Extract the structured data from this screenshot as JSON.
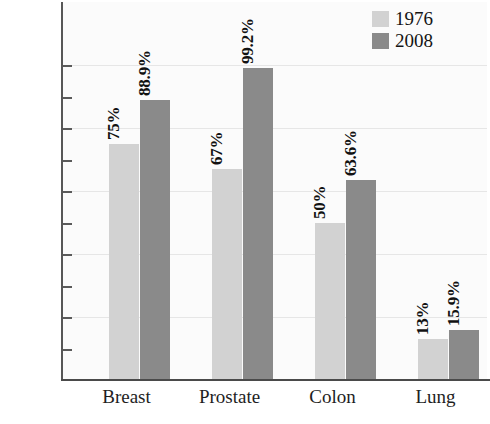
{
  "chart_data": {
    "type": "bar",
    "title": "",
    "subtitle": "",
    "xlabel": "",
    "ylabel": "",
    "categories": [
      "Breast",
      "Prostate",
      "Colon",
      "Lung"
    ],
    "series": [
      {
        "name": "1976",
        "color": "#d2d2d2",
        "values": [
          75,
          67,
          50,
          13
        ],
        "labels": [
          "75%",
          "67%",
          "50%",
          "13%"
        ]
      },
      {
        "name": "2008",
        "color": "#8a8a8a",
        "values": [
          88.9,
          99.2,
          63.6,
          15.9
        ],
        "labels": [
          "88.9%",
          "99.2%",
          "63.6%",
          "15.9%"
        ]
      }
    ],
    "ylim": [
      0,
      110
    ],
    "ytick_values": [
      10,
      20,
      30,
      40,
      50,
      60,
      70,
      80,
      90,
      100
    ],
    "ytick_labels": [
      "10%",
      "20%",
      "30%",
      "40%",
      "50%",
      "60%",
      "70%",
      "80%",
      "90%",
      "100%"
    ],
    "gridline_values": [
      20,
      40,
      60,
      80,
      100
    ],
    "grid": true,
    "legend_position": "top-right",
    "legend_entries": [
      "1976",
      "2008"
    ]
  },
  "legend": {
    "items": [
      {
        "label": "1976"
      },
      {
        "label": "2008"
      }
    ]
  }
}
